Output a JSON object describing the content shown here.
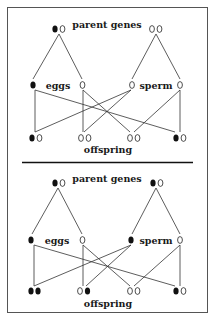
{
  "colors": {
    "ink": "#1a1a1a",
    "line": "#333333",
    "border": "#555555",
    "background": "#ffffff",
    "dominant_allele": "#111111",
    "recessive_allele": "#ffffff"
  },
  "panels": [
    {
      "id": "top",
      "labels": {
        "parent_genes": "parent genes",
        "eggs": "eggs",
        "sperm": "sperm",
        "offspring": "offspring"
      },
      "parents": {
        "female": [
          "black",
          "white"
        ],
        "male": [
          "white",
          "white"
        ]
      },
      "eggs": [
        "black",
        "white"
      ],
      "sperm": [
        "white",
        "white"
      ],
      "offspring": [
        [
          "black",
          "white"
        ],
        [
          "white",
          "white"
        ],
        [
          "white",
          "white"
        ],
        [
          "black",
          "white"
        ]
      ]
    },
    {
      "id": "bottom",
      "labels": {
        "parent_genes": "parent genes",
        "eggs": "eggs",
        "sperm": "sperm",
        "offspring": "offspring"
      },
      "parents": {
        "female": [
          "black",
          "white"
        ],
        "male": [
          "black",
          "white"
        ]
      },
      "eggs": [
        "black",
        "white"
      ],
      "sperm": [
        "black",
        "white"
      ],
      "offspring": [
        [
          "black",
          "black"
        ],
        [
          "white",
          "black"
        ],
        [
          "white",
          "white"
        ],
        [
          "black",
          "white"
        ]
      ]
    }
  ]
}
